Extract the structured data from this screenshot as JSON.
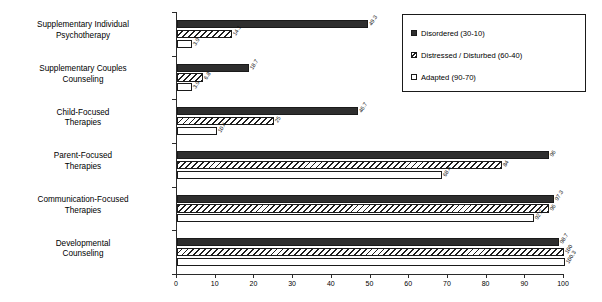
{
  "chart_data": {
    "type": "bar",
    "orientation": "horizontal",
    "title": "",
    "xlabel": "",
    "ylabel": "",
    "xlim": [
      0,
      100
    ],
    "xticks": [
      0,
      10,
      20,
      30,
      40,
      50,
      60,
      70,
      80,
      90,
      100
    ],
    "grid": false,
    "legend_position": "top-right",
    "categories": [
      "Supplementary Individual\nPsychotherapy",
      "Supplementary Couples\nCounseling",
      "Child-Focused\nTherapies",
      "Parent-Focused\nTherapies",
      "Communication-Focused\nTherapies",
      "Developmental\nCounseling"
    ],
    "series": [
      {
        "name": "Disordered (30-10)",
        "pattern": "dark",
        "color": "#2e2e2e",
        "values": [
          49.3,
          18.7,
          46.7,
          96,
          97.3,
          98.7
        ]
      },
      {
        "name": "Distressed / Disturbed (60-40)",
        "pattern": "hatch",
        "color": "#1f1f1f",
        "values": [
          14.1,
          6.8,
          25,
          84,
          96,
          100
        ]
      },
      {
        "name": "Adapted (90-70)",
        "pattern": "white",
        "color": "#ffffff",
        "values": [
          3.9,
          3.9,
          10.4,
          68.4,
          92.2,
          100.3
        ]
      }
    ]
  },
  "legend": {
    "items": [
      {
        "label": "Disordered (30-10)",
        "swatch": "dark"
      },
      {
        "label": "Distressed / Disturbed (60-40)",
        "swatch": "hatch"
      },
      {
        "label": "Adapted (90-70)",
        "swatch": "white"
      }
    ]
  },
  "axis": {
    "tick_labels": [
      "0",
      "10",
      "20",
      "30",
      "40",
      "50",
      "60",
      "70",
      "80",
      "90",
      "100"
    ]
  }
}
